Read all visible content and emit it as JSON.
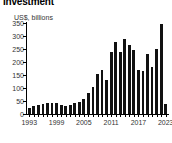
{
  "chart_data": {
    "type": "bar",
    "title": "Investment",
    "subtitle": "US$, billions",
    "xlabel": "",
    "ylabel": "US$, billions",
    "ylim": [
      0,
      350
    ],
    "yticks": [
      0,
      50,
      100,
      150,
      200,
      250,
      300,
      350
    ],
    "ytick_labels": [
      "0",
      "50",
      "100",
      "150",
      "200",
      "250",
      "300",
      "350"
    ],
    "xtick_labels": [
      "1993",
      "1999",
      "2005",
      "2011",
      "2017",
      "2023"
    ],
    "xticks": [
      1993,
      1999,
      2005,
      2011,
      2017,
      2023
    ],
    "grid": false,
    "legend": false,
    "bar_color": "#111111",
    "categories": [
      "1993",
      "1994",
      "1995",
      "1996",
      "1997",
      "1998",
      "1999",
      "2000",
      "2001",
      "2002",
      "2003",
      "2004",
      "2005",
      "2006",
      "2007",
      "2008",
      "2009",
      "2010",
      "2011",
      "2012",
      "2013",
      "2014",
      "2015",
      "2016",
      "2017",
      "2018",
      "2019",
      "2020",
      "2021",
      "2022",
      "2023"
    ],
    "values": [
      25,
      32,
      34,
      37,
      41,
      42,
      41,
      33,
      32,
      34,
      43,
      47,
      57,
      79,
      105,
      155,
      170,
      130,
      240,
      278,
      238,
      288,
      265,
      248,
      170,
      164,
      232,
      182,
      250,
      345,
      40
    ]
  }
}
